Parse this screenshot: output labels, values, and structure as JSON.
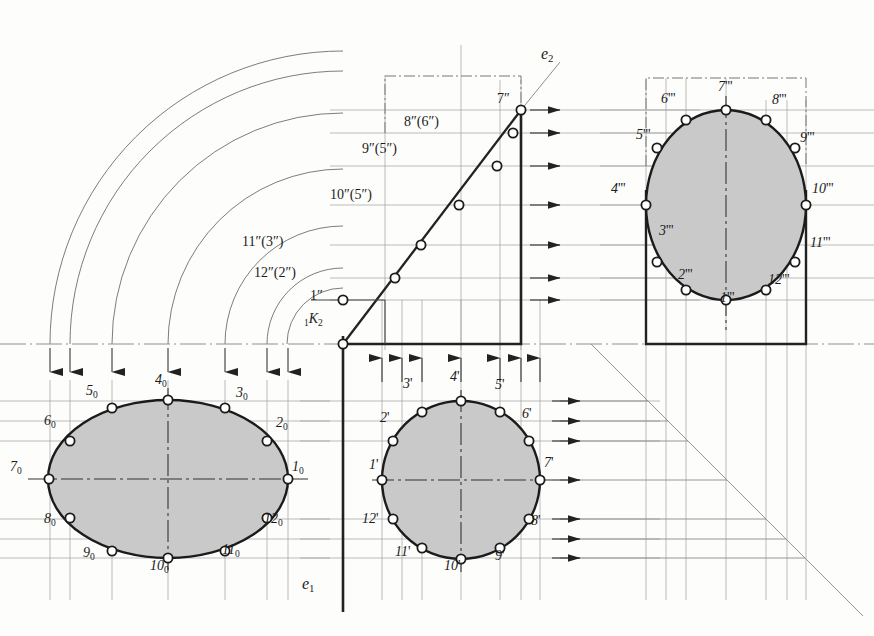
{
  "figure": {
    "kind": "descriptive-geometry-projection",
    "background": "#fdfdfc",
    "ink": "#1b1b1b",
    "thin_line": "#9a9a9a",
    "fill": "#c8c8c8",
    "vertex_fill": "#ffffff"
  },
  "axes": {
    "e1": "e",
    "e1_sub": "1",
    "e2": "e",
    "e2_sub": "2",
    "origin_pre": "1",
    "origin_k": "K",
    "origin_sub": "2"
  },
  "views": {
    "auxiliary": {
      "name": "auxiliary-true-shape-ellipse",
      "suffix": "0",
      "center": [
        168,
        479
      ],
      "rx": 120,
      "ry": 79,
      "labels": [
        "1",
        "2",
        "3",
        "4",
        "5",
        "6",
        "7",
        "8",
        "9",
        "10",
        "11",
        "12"
      ]
    },
    "plan": {
      "name": "plan-view-circle",
      "suffix": "'",
      "center": [
        461,
        480
      ],
      "r": 79,
      "labels": [
        "1",
        "2",
        "3",
        "4",
        "5",
        "6",
        "7",
        "8",
        "9",
        "10",
        "11",
        "12"
      ]
    },
    "front": {
      "name": "front-view-edge-line",
      "suffix": "\"",
      "labels": [
        "1\"",
        "12\"(2\")",
        "11\"(3\")",
        "10\"(5\")",
        "9\"(5\")",
        "8\"(6\")",
        "7\""
      ]
    },
    "side": {
      "name": "side-view-ellipse",
      "suffix": "'''",
      "center": [
        726,
        205
      ],
      "rx": 80,
      "ry": 95,
      "labels": [
        "1",
        "2",
        "3",
        "4",
        "5",
        "6",
        "7",
        "8",
        "9",
        "10",
        "11",
        "12"
      ]
    }
  },
  "front_labels": [
    {
      "id": "front-label-1",
      "text": "1",
      "marks": "″",
      "x": 310,
      "y": 296
    },
    {
      "id": "front-label-12-2",
      "text": "12",
      "marks": "″(2″)",
      "x": 268,
      "y": 274
    },
    {
      "id": "front-label-11-3",
      "text": "11",
      "marks": "″(3″)",
      "x": 255,
      "y": 243
    },
    {
      "id": "front-label-10-5",
      "text": "10",
      "marks": "″(5″)",
      "x": 398,
      "y": 196
    },
    {
      "id": "front-label-9-5",
      "text": "9",
      "marks": "″(5″)",
      "x": 420,
      "y": 150
    },
    {
      "id": "front-label-8-6",
      "text": "8",
      "marks": "″(6″)",
      "x": 452,
      "y": 123
    },
    {
      "id": "front-label-7",
      "text": "7",
      "marks": "″",
      "x": 510,
      "y": 100
    }
  ],
  "aux_labels": [
    {
      "n": "1",
      "x": 292,
      "y": 468
    },
    {
      "n": "2",
      "x": 276,
      "y": 424
    },
    {
      "n": "3",
      "x": 236,
      "y": 394
    },
    {
      "n": "4",
      "x": 157,
      "y": 381
    },
    {
      "n": "5",
      "x": 88,
      "y": 392
    },
    {
      "n": "6",
      "x": 46,
      "y": 422
    },
    {
      "n": "7",
      "x": 12,
      "y": 468
    },
    {
      "n": "8",
      "x": 46,
      "y": 520
    },
    {
      "n": "9",
      "x": 85,
      "y": 554
    },
    {
      "n": "10",
      "x": 154,
      "y": 567
    },
    {
      "n": "11",
      "x": 226,
      "y": 551
    },
    {
      "n": "12",
      "x": 268,
      "y": 520
    }
  ],
  "plan_labels": [
    {
      "n": "1",
      "x": 371,
      "y": 466
    },
    {
      "n": "2",
      "x": 382,
      "y": 419
    },
    {
      "n": "3",
      "x": 405,
      "y": 385
    },
    {
      "n": "4",
      "x": 452,
      "y": 378
    },
    {
      "n": "5",
      "x": 497,
      "y": 386
    },
    {
      "n": "6",
      "x": 524,
      "y": 415
    },
    {
      "n": "7",
      "x": 541,
      "y": 464
    },
    {
      "n": "8",
      "x": 528,
      "y": 522
    },
    {
      "n": "9",
      "x": 497,
      "y": 557
    },
    {
      "n": "10",
      "x": 448,
      "y": 567
    },
    {
      "n": "11",
      "x": 399,
      "y": 553
    },
    {
      "n": "12",
      "x": 366,
      "y": 520
    }
  ],
  "side_labels": [
    {
      "n": "1",
      "x": 722,
      "y": 299
    },
    {
      "n": "2",
      "x": 682,
      "y": 276
    },
    {
      "n": "3",
      "x": 663,
      "y": 232
    },
    {
      "n": "4",
      "x": 615,
      "y": 190
    },
    {
      "n": "5",
      "x": 640,
      "y": 136
    },
    {
      "n": "6",
      "x": 665,
      "y": 100
    },
    {
      "n": "7",
      "x": 721,
      "y": 88
    },
    {
      "n": "8",
      "x": 775,
      "y": 101
    },
    {
      "n": "9",
      "x": 803,
      "y": 139
    },
    {
      "n": "10",
      "x": 812,
      "y": 190
    },
    {
      "n": "11",
      "x": 808,
      "y": 244
    },
    {
      "n": "12",
      "x": 768,
      "y": 281
    }
  ]
}
